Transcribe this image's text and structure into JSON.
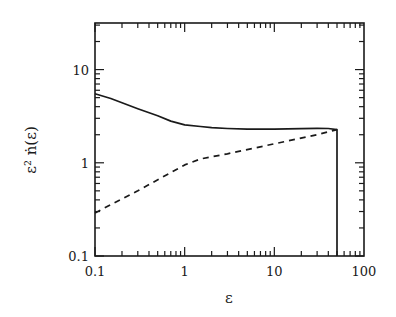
{
  "chart_data": {
    "type": "line",
    "title": "",
    "xlabel": "ε",
    "ylabel": "ε² ṅ(ε)",
    "xscale": "log",
    "yscale": "log",
    "xlim": [
      0.1,
      100
    ],
    "ylim": [
      0.1,
      31.6
    ],
    "grid": false,
    "legend": null,
    "x_ticks": [
      {
        "value": 0.1,
        "label": "0.1"
      },
      {
        "value": 1,
        "label": "1"
      },
      {
        "value": 10,
        "label": "10"
      },
      {
        "value": 100,
        "label": "100"
      }
    ],
    "y_ticks": [
      {
        "value": 0.1,
        "label": "0.1"
      },
      {
        "value": 1,
        "label": "1"
      },
      {
        "value": 10,
        "label": "10"
      }
    ],
    "series": [
      {
        "name": "solid",
        "style": "solid",
        "x": [
          0.1,
          0.15,
          0.2,
          0.3,
          0.5,
          0.7,
          1.0,
          1.5,
          2,
          3,
          5,
          10,
          20,
          30,
          40,
          50,
          50
        ],
        "y": [
          5.5,
          4.9,
          4.4,
          3.8,
          3.2,
          2.8,
          2.55,
          2.45,
          2.38,
          2.33,
          2.3,
          2.3,
          2.32,
          2.34,
          2.33,
          2.27,
          0.1
        ]
      },
      {
        "name": "dashed",
        "style": "dashed",
        "x": [
          0.1,
          0.3,
          1.0,
          1.5,
          3,
          10,
          30,
          50
        ],
        "y": [
          0.29,
          0.5,
          0.95,
          1.1,
          1.25,
          1.6,
          2.0,
          2.27
        ]
      }
    ]
  }
}
